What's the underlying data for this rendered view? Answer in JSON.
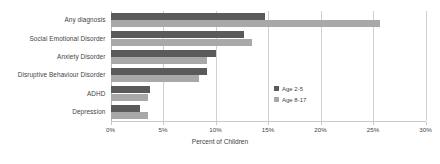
{
  "chart_data": {
    "type": "bar",
    "orientation": "horizontal",
    "title": "",
    "xlabel": "Percent of Children",
    "ylabel": "",
    "xlim": [
      0,
      30
    ],
    "xticks": [
      "0%",
      "5%",
      "10%",
      "15%",
      "20%",
      "25%",
      "30%"
    ],
    "xtick_values": [
      0,
      5,
      10,
      15,
      20,
      25,
      30
    ],
    "grid": true,
    "legend_position": "inside-right",
    "categories": [
      "Any diagnosis",
      "Social Emotional Disorder",
      "Anxiety Disorder",
      "Disruptive Behaviour Disorder",
      "ADHD",
      "Depression"
    ],
    "series": [
      {
        "name": "Age 2-5",
        "color": "#5a5a5a",
        "values": [
          14.7,
          12.7,
          10.0,
          9.2,
          3.8,
          2.8
        ]
      },
      {
        "name": "Age 8-17",
        "color": "#a8a8a8",
        "values": [
          25.7,
          13.5,
          9.2,
          8.4,
          3.6,
          3.6
        ]
      }
    ]
  },
  "legend": {
    "items": [
      {
        "label": "Age 2-5",
        "color": "#5a5a5a"
      },
      {
        "label": "Age 8-17",
        "color": "#a8a8a8"
      }
    ]
  },
  "topnote": {
    "text": ""
  }
}
